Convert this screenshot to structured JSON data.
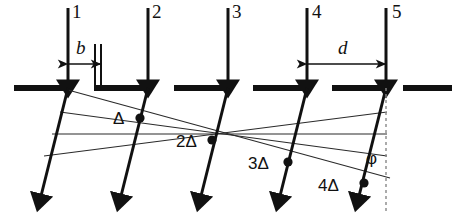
{
  "figure": {
    "type": "diagram",
    "background_color": "#ffffff",
    "stroke_color": "#111111",
    "thin_stroke_color": "#2a2a2a",
    "dashed_color": "#888888",
    "width": 460,
    "height": 216
  },
  "beam_labels": [
    {
      "id": "1",
      "text": "1",
      "x": 72,
      "y": 4
    },
    {
      "id": "2",
      "text": "2",
      "x": 152,
      "y": 4
    },
    {
      "id": "3",
      "text": "3",
      "x": 232,
      "y": 4
    },
    {
      "id": "4",
      "text": "4",
      "x": 312,
      "y": 4
    },
    {
      "id": "5",
      "text": "5",
      "x": 392,
      "y": 4
    }
  ],
  "dimensions": {
    "b": {
      "label": "b",
      "label_x": 76,
      "label_y": 38,
      "from_x": 68,
      "to_x": 101,
      "y": 64
    },
    "d": {
      "label": "d",
      "label_x": 338,
      "label_y": 38,
      "from_x": 307,
      "to_x": 386,
      "y": 64
    }
  },
  "path_difference_labels": [
    {
      "text": "Δ",
      "x": 113,
      "y": 110
    },
    {
      "text": "2Δ",
      "x": 176,
      "y": 133
    },
    {
      "text": "3Δ",
      "x": 248,
      "y": 155
    },
    {
      "text": "4Δ",
      "x": 318,
      "y": 177
    }
  ],
  "angle_label": {
    "text": "φ",
    "x": 366,
    "y": 150
  },
  "incident_beams_x": [
    68,
    148,
    228,
    307,
    386
  ],
  "incident_beam_top_y": 8,
  "grating_y": 88,
  "grating_segments": [
    {
      "x1": 14,
      "x2": 72,
      "riser": false
    },
    {
      "x1": 94,
      "x2": 152,
      "riser": true
    },
    {
      "x1": 174,
      "x2": 232,
      "riser": false
    },
    {
      "x1": 253,
      "x2": 311,
      "riser": false
    },
    {
      "x1": 332,
      "x2": 390,
      "riser": false
    },
    {
      "x1": 403,
      "x2": 452,
      "riser": false
    }
  ],
  "diffracted_beams": [
    {
      "start_x": 68,
      "start_y": 88,
      "end_x": 38,
      "end_y": 208
    },
    {
      "start_x": 148,
      "start_y": 88,
      "end_x": 118,
      "end_y": 208
    },
    {
      "start_x": 228,
      "start_y": 88,
      "end_x": 198,
      "end_y": 208
    },
    {
      "start_x": 307,
      "start_y": 88,
      "end_x": 277,
      "end_y": 208
    },
    {
      "start_x": 386,
      "start_y": 88,
      "end_x": 356,
      "end_y": 208
    }
  ],
  "wavefront_lines": [
    {
      "x1": 68,
      "y1": 90,
      "x2": 390,
      "y2": 178
    },
    {
      "x1": 60,
      "y1": 112,
      "x2": 386,
      "y2": 156
    },
    {
      "x1": 52,
      "y1": 134,
      "x2": 386,
      "y2": 134
    },
    {
      "x1": 44,
      "y1": 156,
      "x2": 386,
      "y2": 112
    }
  ],
  "wavefront_dots": [
    {
      "x": 140,
      "y": 118
    },
    {
      "x": 212,
      "y": 140
    },
    {
      "x": 288,
      "y": 162
    },
    {
      "x": 364,
      "y": 183
    }
  ],
  "dashed_vertical": {
    "x": 386,
    "y1": 88,
    "y2": 212
  }
}
